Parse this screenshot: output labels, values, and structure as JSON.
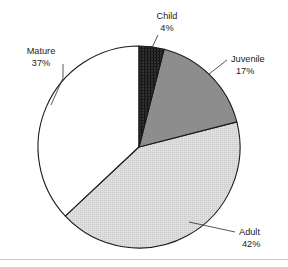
{
  "chart_data": {
    "type": "pie",
    "title": "",
    "subtitle": "",
    "xlabel": "",
    "ylabel": "",
    "legend_position": "none",
    "grid": false,
    "units": "percent",
    "total": 100,
    "start_angle_deg": 0,
    "direction": "clockwise",
    "categories": [
      "Child",
      "Juvenile",
      "Adult",
      "Mature"
    ],
    "values": [
      4,
      17,
      42,
      37
    ],
    "slices": [
      {
        "label": "Child",
        "value": 4,
        "value_text": "4%",
        "fill_style": "dark-hatch",
        "color": "#3a3a3a",
        "start_deg": 0,
        "end_deg": 14.4,
        "label_x": 167,
        "label_y": 19,
        "value_x": 167,
        "value_y": 31,
        "label_anchor": "middle"
      },
      {
        "label": "Juvenile",
        "value": 17,
        "value_text": "17%",
        "fill_style": "solid-gray",
        "color": "#8d8d8d",
        "start_deg": 14.4,
        "end_deg": 75.6,
        "label_x": 231,
        "label_y": 62,
        "value_x": 231,
        "value_y": 74,
        "label_anchor": "start"
      },
      {
        "label": "Adult",
        "value": 42,
        "value_text": "42%",
        "fill_style": "light-stipple",
        "color": "#d9d9d9",
        "start_deg": 75.6,
        "end_deg": 226.8,
        "label_x": 239,
        "label_y": 235,
        "value_x": 239,
        "value_y": 247,
        "label_anchor": "start"
      },
      {
        "label": "Mature",
        "value": 37,
        "value_text": "37%",
        "fill_style": "white",
        "color": "#ffffff",
        "start_deg": 226.8,
        "end_deg": 360,
        "label_x": 41,
        "label_y": 54,
        "value_x": 41,
        "value_y": 66,
        "label_anchor": "middle"
      }
    ],
    "geometry": {
      "center_x": 139,
      "center_y": 147,
      "radius": 101
    },
    "colors": {
      "outline": "#1a1a1a",
      "text": "#1b1b1b",
      "leader": "#2b2b2b",
      "baseline_rule": "#c9c9c9",
      "background": "#ffffff"
    }
  }
}
